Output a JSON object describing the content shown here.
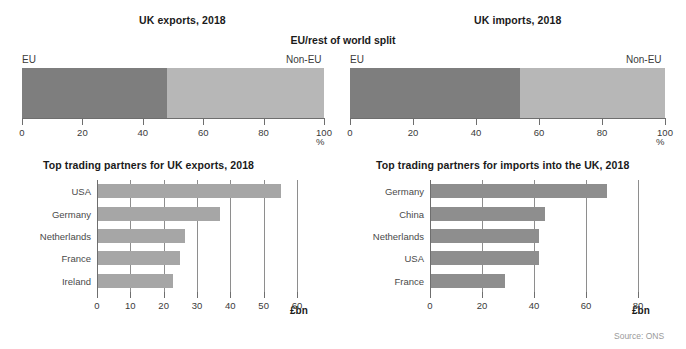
{
  "figure": {
    "center_title": "EU/rest of world split",
    "source": "Source: ONS"
  },
  "panels": {
    "exports_split": {
      "title": "UK exports, 2018",
      "left_label": "EU",
      "right_label": "Non-EU",
      "unit": "%"
    },
    "imports_split": {
      "title": "UK imports, 2018",
      "left_label": "EU",
      "right_label": "Non-EU",
      "unit": "%"
    },
    "exports_partners": {
      "title": "Top trading partners for UK exports, 2018",
      "unit": "£bn"
    },
    "imports_partners": {
      "title": "Top trading partners for imports into the UK, 2018",
      "unit": "£bn"
    }
  },
  "colors": {
    "eu_segment": "#7e7e7e",
    "non_eu_segment": "#b7b7b7",
    "exports_bar": "#a6a6a6",
    "imports_bar": "#8e8e8e",
    "axis": "#6e6e6e",
    "text": "#3a3a3a",
    "source_text": "#9a9a9a"
  },
  "chart_data": [
    {
      "id": "exports_split",
      "type": "bar",
      "orientation": "horizontal-stacked",
      "title": "UK exports, 2018",
      "xlabel": "%",
      "ylabel": "",
      "xlim": [
        0,
        100
      ],
      "xticks": [
        0,
        20,
        40,
        60,
        80,
        100
      ],
      "xticklabels": [
        "0",
        "20",
        "40",
        "60",
        "80",
        "100"
      ],
      "grid": false,
      "categories": [
        "UK exports, 2018"
      ],
      "series": [
        {
          "name": "EU",
          "values": [
            48
          ]
        },
        {
          "name": "Non-EU",
          "values": [
            52
          ]
        }
      ],
      "annotations": [
        "EU",
        "Non-EU"
      ]
    },
    {
      "id": "imports_split",
      "type": "bar",
      "orientation": "horizontal-stacked",
      "title": "UK imports, 2018",
      "xlabel": "%",
      "ylabel": "",
      "xlim": [
        0,
        100
      ],
      "xticks": [
        0,
        20,
        40,
        60,
        80,
        100
      ],
      "xticklabels": [
        "0",
        "20",
        "40",
        "60",
        "80",
        "100"
      ],
      "grid": false,
      "categories": [
        "UK imports, 2018"
      ],
      "series": [
        {
          "name": "EU",
          "values": [
            54
          ]
        },
        {
          "name": "Non-EU",
          "values": [
            46
          ]
        }
      ],
      "annotations": [
        "EU",
        "Non-EU"
      ]
    },
    {
      "id": "exports_partners",
      "type": "bar",
      "orientation": "horizontal",
      "title": "Top trading partners for UK exports, 2018",
      "xlabel": "£bn",
      "ylabel": "",
      "xlim": [
        0,
        60
      ],
      "xticks": [
        0,
        10,
        20,
        30,
        40,
        50,
        60
      ],
      "xticklabels": [
        "0",
        "10",
        "20",
        "30",
        "40",
        "50",
        "60"
      ],
      "grid": true,
      "categories": [
        "USA",
        "Germany",
        "Netherlands",
        "France",
        "Ireland"
      ],
      "values": [
        55,
        36.5,
        26,
        24.5,
        22.5
      ]
    },
    {
      "id": "imports_partners",
      "type": "bar",
      "orientation": "horizontal",
      "title": "Top trading partners for imports into the UK, 2018",
      "xlabel": "£bn",
      "ylabel": "",
      "xlim": [
        0,
        80
      ],
      "xticks": [
        0,
        20,
        40,
        60,
        80
      ],
      "xticklabels": [
        "0",
        "20",
        "40",
        "60",
        "80"
      ],
      "grid": true,
      "categories": [
        "Germany",
        "China",
        "Netherlands",
        "USA",
        "France"
      ],
      "values": [
        67.5,
        44,
        41.5,
        41.5,
        28.5
      ]
    }
  ]
}
